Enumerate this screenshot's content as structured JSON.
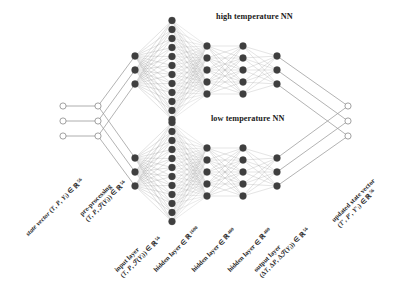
{
  "diagram": {
    "title_high": "high temperature NN",
    "title_low": "low temperature NN",
    "background": "#ffffff",
    "node_dark_color": "#3f3f3f",
    "node_open_color": "#ffffff",
    "node_stroke_color": "#7a7a7a",
    "edge_color": "#9a9a9a"
  },
  "labels": {
    "state_vector": {
      "line1": "state vector (T, P, Y",
      "sub1": "i",
      "line1b": ") ∈ ℝ",
      "sup1": "56"
    },
    "pre_processing": {
      "line1": "pre-processing",
      "line2a": "(T, P, ℱ(Y",
      "sub2": "i",
      "line2b": ")) ∈ ℝ",
      "sup2": "56"
    },
    "input_layer": {
      "line1": "input layer",
      "line2a": "(T, P, ℱ(Y",
      "sub2": "i",
      "line2b": ")) ∈ ℝ",
      "sup2": "56"
    },
    "hidden_layer_1": {
      "text": "hidden layer ∈ ℝ",
      "sup": "1600"
    },
    "hidden_layer_2": {
      "text": "hidden layer ∈ ℝ",
      "sup": "400"
    },
    "hidden_layer_3": {
      "text": "hidden layer ∈ ℝ",
      "sup": "400"
    },
    "output_layer": {
      "line1": "output layer",
      "line2a": "(ΔT, ΔP, Δℱ(Y",
      "sub2": "i",
      "line2b": ")) ∈ ℝ",
      "sup2": "56"
    },
    "updated_state_vector": {
      "line1": "updated state vector",
      "line2a": "(T′, P′, Y′",
      "sub2": "i",
      "line2b": ") ∈ ℝ",
      "sup2": "56"
    }
  },
  "chart_data": {
    "type": "diagram",
    "architecture": "dual-branch feed-forward neural network",
    "branches": [
      {
        "name": "high temperature NN",
        "layers": [
          {
            "name": "input layer",
            "drawn_nodes": 3,
            "dim": 56
          },
          {
            "name": "hidden layer 1",
            "drawn_nodes": 12,
            "dim": 1600
          },
          {
            "name": "hidden layer 2",
            "drawn_nodes": 5,
            "dim": 400
          },
          {
            "name": "hidden layer 3",
            "drawn_nodes": 5,
            "dim": 400
          },
          {
            "name": "output layer",
            "drawn_nodes": 3,
            "dim": 56
          }
        ]
      },
      {
        "name": "low temperature NN",
        "layers": [
          {
            "name": "input layer",
            "drawn_nodes": 3,
            "dim": 56
          },
          {
            "name": "hidden layer 1",
            "drawn_nodes": 12,
            "dim": 1600
          },
          {
            "name": "hidden layer 2",
            "drawn_nodes": 5,
            "dim": 400
          },
          {
            "name": "hidden layer 3",
            "drawn_nodes": 5,
            "dim": 400
          },
          {
            "name": "output layer",
            "drawn_nodes": 3,
            "dim": 56
          }
        ]
      }
    ],
    "external_nodes": [
      {
        "name": "state vector",
        "drawn_nodes": 3,
        "dim": 56
      },
      {
        "name": "pre-processing",
        "drawn_nodes": 3,
        "dim": 56
      },
      {
        "name": "updated state vector",
        "drawn_nodes": 3,
        "dim": 56
      }
    ]
  }
}
